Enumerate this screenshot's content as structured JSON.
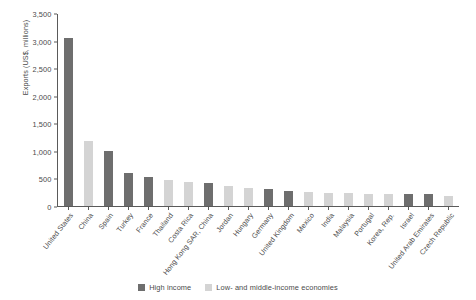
{
  "chart_data": {
    "type": "bar",
    "title": "",
    "xlabel": "",
    "ylabel": "Exports (US$, millions)",
    "ylim": [
      0,
      3500
    ],
    "ytick_labels": [
      "3,500",
      "3,000",
      "2,500",
      "2,000",
      "1,500",
      "1,000",
      "500",
      "0"
    ],
    "ytick_values": [
      3500,
      3000,
      2500,
      2000,
      1500,
      1000,
      500,
      0
    ],
    "grid": false,
    "legend_position": "bottom-center",
    "legend": [
      {
        "key": "high",
        "label": "High income",
        "color": "#6e6e6e"
      },
      {
        "key": "lowmid",
        "label": "Low- and middle-income economies",
        "color": "#d4d4d4"
      }
    ],
    "categories": [
      "United States",
      "China",
      "Spain",
      "Turkey",
      "France",
      "Thailand",
      "Costa Rica",
      "Hong Kong SAR, China",
      "Jordan",
      "Hungary",
      "Germany",
      "United Kingdom",
      "Mexico",
      "India",
      "Malaysia",
      "Portugal",
      "Korea, Rep.",
      "Israel",
      "United Arab Emirates",
      "Czech Republic"
    ],
    "values": [
      3050,
      1180,
      1000,
      600,
      530,
      470,
      430,
      410,
      370,
      330,
      300,
      270,
      250,
      240,
      230,
      225,
      215,
      210,
      210,
      180
    ],
    "groups": [
      "high",
      "lowmid",
      "high",
      "high",
      "high",
      "lowmid",
      "lowmid",
      "high",
      "lowmid",
      "lowmid",
      "high",
      "high",
      "lowmid",
      "lowmid",
      "lowmid",
      "lowmid",
      "lowmid",
      "high",
      "high",
      "lowmid"
    ]
  }
}
